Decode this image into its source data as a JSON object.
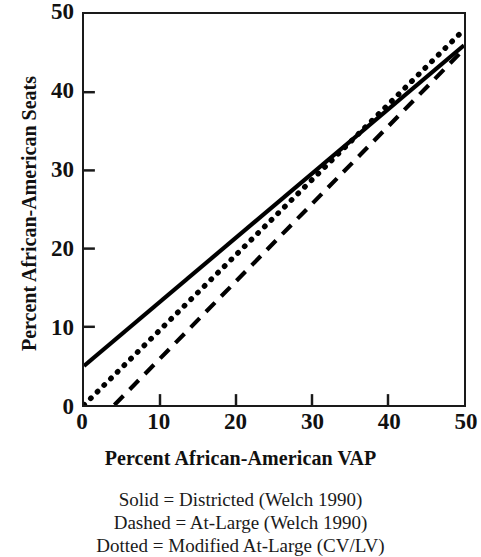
{
  "chart_data": {
    "type": "line",
    "title": "",
    "xlabel": "Percent African-American VAP",
    "ylabel": "Percent African-American Seats",
    "xlim": [
      0,
      50
    ],
    "ylim": [
      0,
      50
    ],
    "xticks": [
      0,
      10,
      20,
      30,
      40,
      50
    ],
    "yticks": [
      0,
      10,
      20,
      30,
      40,
      50
    ],
    "xticklabels": [
      "0",
      "10",
      "20",
      "30",
      "40",
      "50"
    ],
    "yticklabels": [
      "0",
      "10",
      "20",
      "30",
      "40",
      "50"
    ],
    "grid": false,
    "legend_position": "below-axes",
    "series": [
      {
        "name": "Districted (Welch 1990)",
        "style": "solid",
        "color": "#000000",
        "x": [
          0,
          50
        ],
        "y": [
          5.0,
          46.0
        ],
        "intercept": 5.0,
        "slope": 0.82
      },
      {
        "name": "At-Large (Welch 1990)",
        "style": "dashed",
        "color": "#000000",
        "x": [
          4.0,
          50
        ],
        "y": [
          0.0,
          45.5
        ],
        "intercept": -3.96,
        "slope": 0.989
      },
      {
        "name": "Modified At-Large (CV/LV)",
        "style": "dotted",
        "color": "#000000",
        "x": [
          0,
          50
        ],
        "y": [
          0.0,
          48.0
        ],
        "intercept": 0.0,
        "slope": 0.96
      }
    ]
  },
  "axes": {
    "x_title": "Percent African-American VAP",
    "y_title": "Percent African-American Seats",
    "x_tick_labels": [
      "0",
      "10",
      "20",
      "30",
      "40",
      "50"
    ],
    "y_tick_labels": [
      "0",
      "10",
      "20",
      "30",
      "40",
      "50"
    ]
  },
  "legend": {
    "lines": [
      "Solid = Districted (Welch 1990)",
      "Dashed = At-Large (Welch 1990)",
      "Dotted = Modified At-Large (CV/LV)"
    ]
  },
  "colors": {
    "line": "#000000",
    "frame": "#1a1a1a",
    "background": "#ffffff",
    "text": "#111111"
  }
}
